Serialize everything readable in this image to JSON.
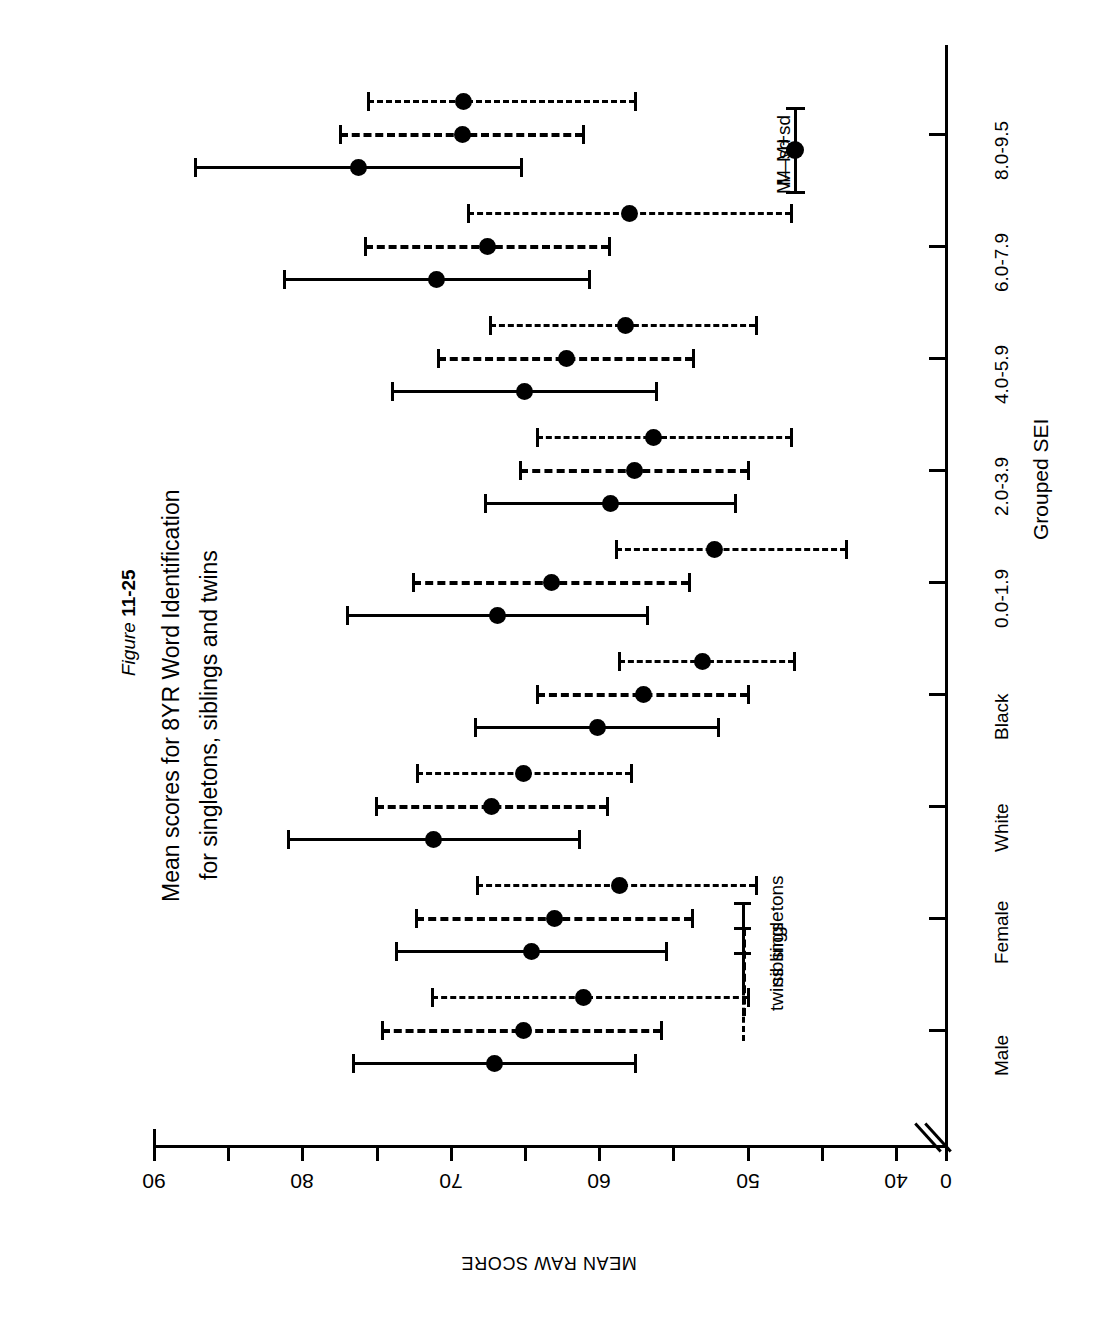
{
  "figure": {
    "prefix": "Figure ",
    "number": "11-25"
  },
  "title": {
    "line1": "Mean scores for 8YR Word Identification",
    "line2": "for singletons, siblings and twins"
  },
  "axis": {
    "value_axis_label": "MEAN RAW SCORE",
    "category_axis_label": "Grouped SEI",
    "value_ticks": [
      "90",
      "80",
      "70",
      "60",
      "50",
      "40",
      "0"
    ],
    "break_marker": "axis-break"
  },
  "legend_series": {
    "items": [
      {
        "key": "singletons",
        "label": "singletons",
        "style": "solid"
      },
      {
        "key": "siblings",
        "label": "siblings",
        "style": "dashed-long"
      },
      {
        "key": "twins",
        "label": "twins",
        "style": "dashed-short"
      }
    ]
  },
  "legend_marker": {
    "upper_label": "M+sd",
    "center_label": "M",
    "lower_label": "M—sd"
  },
  "chart_data": {
    "type": "scatter",
    "subtitle": "Figure 11-25",
    "xlabel": "Grouped SEI",
    "ylabel": "MEAN RAW SCORE",
    "orientation": "horizontal-error-bars",
    "grid": false,
    "legend_position": "inside-left",
    "ylim": [
      40,
      90
    ],
    "ytick_step": 5,
    "axis_break": true,
    "categories": [
      "Male",
      "Female",
      "White",
      "Black",
      "0.0-1.9",
      "2.0-3.9",
      "4.0-5.9",
      "6.0-7.9",
      "8.0-9.5"
    ],
    "series": [
      {
        "name": "singletons",
        "style": "solid",
        "mean": [
          67.0,
          64.5,
          71.1,
          60.1,
          66.8,
          59.2,
          65.0,
          70.9,
          76.2
        ],
        "minus_sd": [
          57.5,
          55.4,
          61.3,
          51.9,
          56.7,
          50.8,
          56.1,
          60.6,
          65.2
        ],
        "plus_sd": [
          76.5,
          73.6,
          80.9,
          68.3,
          76.9,
          67.6,
          73.9,
          81.2,
          87.2
        ]
      },
      {
        "name": "siblings",
        "style": "dashed-long",
        "mean": [
          65.1,
          63.0,
          67.2,
          57.0,
          63.2,
          57.6,
          62.2,
          67.5,
          69.2
        ],
        "minus_sd": [
          55.8,
          53.7,
          59.4,
          49.9,
          53.9,
          49.9,
          53.6,
          59.3,
          61.0
        ],
        "plus_sd": [
          74.6,
          72.3,
          75.0,
          64.1,
          72.5,
          65.3,
          70.8,
          75.7,
          77.4
        ]
      },
      {
        "name": "twins",
        "style": "dashed-short",
        "mean": [
          61.0,
          58.6,
          65.1,
          53.0,
          52.2,
          56.3,
          58.2,
          57.9,
          69.1
        ],
        "minus_sd": [
          49.9,
          49.4,
          57.8,
          46.8,
          43.3,
          47.0,
          49.4,
          47.0,
          57.5
        ],
        "plus_sd": [
          71.2,
          68.2,
          72.2,
          58.6,
          58.8,
          64.1,
          67.3,
          68.8,
          75.5
        ]
      }
    ]
  }
}
